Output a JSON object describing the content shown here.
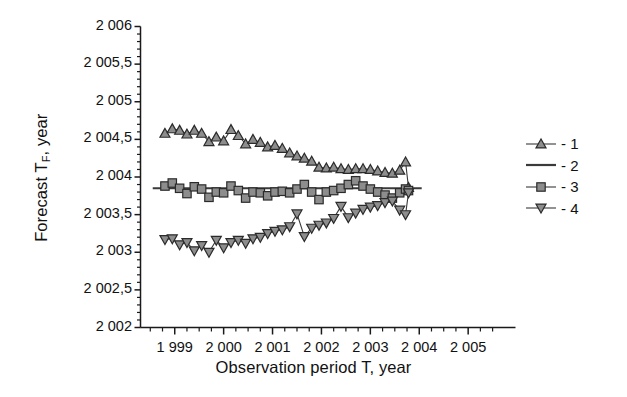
{
  "chart_data": {
    "type": "line",
    "title": "",
    "xlabel": "Observation period T, year",
    "ylabel": "Forecast T<sub>F</sub>, year",
    "ylabel_main": "Forecast T",
    "ylabel_sub": "F",
    "ylabel_tail": ", year",
    "xlim": [
      1998.3,
      2005.6
    ],
    "ylim": [
      2002.0,
      2006.0
    ],
    "grid": false,
    "legend_position": "right",
    "xtick_labels": [
      "1 999",
      "2 000",
      "2 001",
      "2 002",
      "2 003",
      "2 004",
      "2 005"
    ],
    "xtick_values": [
      1999,
      2000,
      2001,
      2002,
      2003,
      2004,
      2005
    ],
    "xminor_step": 0.25,
    "ytick_labels": [
      "2 006",
      "2 005,5",
      "2 005",
      "2 004,5",
      "2 004",
      "2 003,5",
      "2 003",
      "2 002,5",
      "2 002"
    ],
    "ytick_values": [
      2006,
      2005.5,
      2005,
      2004.5,
      2004,
      2003.5,
      2003,
      2002.5,
      2002
    ],
    "yminor_step": 0.1,
    "decimal_separator": ",",
    "thousands_separator": " ",
    "reference_line_value": 2003.85,
    "marker_fill": "#8d8d8d",
    "marker_stroke": "#2b2b2b",
    "line_color": "#3a3a3a",
    "axis_color": "#1a1a1a",
    "series": [
      {
        "name": "1",
        "legend_label": "- 1",
        "marker": "triangle-up",
        "x": [
          1998.8,
          1998.95,
          1999.1,
          1999.25,
          1999.4,
          1999.55,
          1999.7,
          1999.85,
          2000.0,
          2000.15,
          2000.3,
          2000.45,
          2000.6,
          2000.75,
          2000.9,
          2001.05,
          2001.2,
          2001.35,
          2001.5,
          2001.65,
          2001.8,
          2001.95,
          2002.1,
          2002.25,
          2002.4,
          2002.55,
          2002.7,
          2002.85,
          2003.0,
          2003.15,
          2003.3,
          2003.45,
          2003.6,
          2003.72,
          2003.78
        ],
        "y": [
          2004.58,
          2004.64,
          2004.62,
          2004.57,
          2004.62,
          2004.58,
          2004.47,
          2004.53,
          2004.48,
          2004.63,
          2004.55,
          2004.44,
          2004.5,
          2004.46,
          2004.4,
          2004.42,
          2004.38,
          2004.32,
          2004.28,
          2004.25,
          2004.21,
          2004.13,
          2004.12,
          2004.13,
          2004.11,
          2004.1,
          2004.11,
          2004.11,
          2004.1,
          2004.08,
          2004.06,
          2004.05,
          2004.09,
          2004.2,
          2003.86
        ]
      },
      {
        "name": "2",
        "legend_label": "- 2",
        "marker": "none",
        "x": [
          1998.55,
          2004.05
        ],
        "y": [
          2003.85,
          2003.85
        ]
      },
      {
        "name": "3",
        "legend_label": "- 3",
        "marker": "square",
        "x": [
          1998.8,
          1998.95,
          1999.1,
          1999.25,
          1999.4,
          1999.55,
          1999.7,
          1999.85,
          2000.0,
          2000.15,
          2000.3,
          2000.45,
          2000.6,
          2000.75,
          2000.9,
          2001.05,
          2001.2,
          2001.35,
          2001.5,
          2001.65,
          2001.8,
          2001.95,
          2002.1,
          2002.25,
          2002.4,
          2002.55,
          2002.7,
          2002.85,
          2003.0,
          2003.15,
          2003.3,
          2003.45,
          2003.6,
          2003.72,
          2003.78
        ],
        "y": [
          2003.88,
          2003.92,
          2003.85,
          2003.78,
          2003.87,
          2003.84,
          2003.73,
          2003.8,
          2003.79,
          2003.88,
          2003.82,
          2003.72,
          2003.8,
          2003.79,
          2003.75,
          2003.8,
          2003.81,
          2003.79,
          2003.84,
          2003.9,
          2003.8,
          2003.7,
          2003.8,
          2003.82,
          2003.85,
          2003.9,
          2003.95,
          2003.88,
          2003.84,
          2003.8,
          2003.76,
          2003.72,
          2003.79,
          2003.84,
          2003.82
        ]
      },
      {
        "name": "4",
        "legend_label": "- 4",
        "marker": "triangle-down",
        "x": [
          1998.8,
          1998.95,
          1999.1,
          1999.25,
          1999.4,
          1999.55,
          1999.7,
          1999.85,
          2000.0,
          2000.15,
          2000.3,
          2000.45,
          2000.6,
          2000.75,
          2000.9,
          2001.05,
          2001.2,
          2001.35,
          2001.5,
          2001.65,
          2001.8,
          2001.95,
          2002.1,
          2002.25,
          2002.4,
          2002.55,
          2002.7,
          2002.85,
          2003.0,
          2003.15,
          2003.3,
          2003.45,
          2003.6,
          2003.72,
          2003.78
        ],
        "y": [
          2003.17,
          2003.18,
          2003.1,
          2003.13,
          2003.02,
          2003.09,
          2003.0,
          2003.16,
          2003.06,
          2003.13,
          2003.16,
          2003.12,
          2003.18,
          2003.2,
          2003.25,
          2003.28,
          2003.3,
          2003.34,
          2003.51,
          2003.21,
          2003.32,
          2003.36,
          2003.39,
          2003.45,
          2003.61,
          2003.46,
          2003.52,
          2003.57,
          2003.6,
          2003.62,
          2003.66,
          2003.68,
          2003.56,
          2003.5,
          2003.79
        ]
      }
    ]
  }
}
